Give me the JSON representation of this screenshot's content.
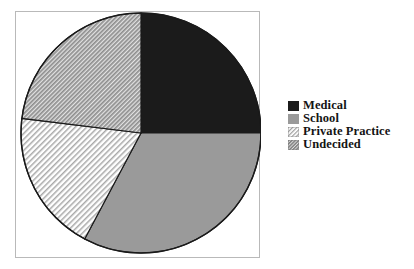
{
  "chart_data": {
    "type": "pie",
    "title": "",
    "subtitle": "",
    "xlabel": "",
    "ylabel": "",
    "grid": false,
    "legend_position": "right",
    "start_angle_deg": 0,
    "direction": "clockwise",
    "center": {
      "x": 141,
      "y": 133
    },
    "radius": 120,
    "categories": [
      "Medical",
      "School",
      "Private Practice",
      "Undecided"
    ],
    "values": [
      25,
      33,
      19,
      23
    ],
    "units": "percent",
    "slices": [
      {
        "label": "Medical",
        "value": 25,
        "start_angle_deg": 0,
        "end_angle_deg": 90,
        "fill_style": "solid",
        "color": "#1b1b1b",
        "swatch": "solid-black-swatch"
      },
      {
        "label": "School",
        "value": 33,
        "start_angle_deg": 90,
        "end_angle_deg": 208,
        "fill_style": "solid",
        "color": "#9a9a9a",
        "swatch": "solid-gray-swatch"
      },
      {
        "label": "Private Practice",
        "value": 19,
        "start_angle_deg": 208,
        "end_angle_deg": 277,
        "fill_style": "diagonal-hatch-light",
        "color": "#e8e8e8",
        "swatch": "light-hatch-swatch"
      },
      {
        "label": "Undecided",
        "value": 23,
        "start_angle_deg": 277,
        "end_angle_deg": 360,
        "fill_style": "diagonal-hatch-dense",
        "color": "#bdbdbd",
        "swatch": "dense-hatch-swatch"
      }
    ]
  },
  "legend": {
    "items": [
      {
        "label": "Medical",
        "swatch": "solid-black-swatch"
      },
      {
        "label": "School",
        "swatch": "solid-gray-swatch"
      },
      {
        "label": "Private Practice",
        "swatch": "light-hatch-swatch"
      },
      {
        "label": "Undecided",
        "swatch": "dense-hatch-swatch"
      }
    ]
  },
  "colors": {
    "medical": "#1b1b1b",
    "school": "#9a9a9a",
    "private_practice": "#e8e8e8",
    "undecided": "#bdbdbd",
    "outline": "#1a1a1a",
    "frame": "#b9b9b9",
    "background": "#ffffff",
    "text": "#141414"
  }
}
